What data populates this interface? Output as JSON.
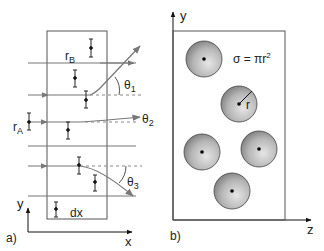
{
  "panel_a": {
    "label": "a)",
    "axis_x": "x",
    "axis_y": "y",
    "slab_label": "dx",
    "radius_B": "r",
    "radius_B_sub": "B",
    "radius_A": "r",
    "radius_A_sub": "A",
    "angles": [
      {
        "sym": "θ",
        "sub": "1"
      },
      {
        "sym": "θ",
        "sub": "2"
      },
      {
        "sym": "θ",
        "sub": "3"
      }
    ]
  },
  "panel_b": {
    "label": "b)",
    "axis_y": "y",
    "axis_z": "z",
    "formula": "σ = πr",
    "formula_exp": "2",
    "radius_label": "r"
  },
  "colors": {
    "line": "#555555",
    "ray": "#777777",
    "sphere_light": "#e6e6e6",
    "sphere_dark": "#777777"
  }
}
